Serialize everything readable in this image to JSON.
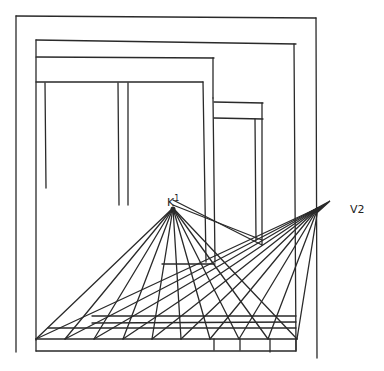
{
  "diagram": {
    "labels": {
      "v1": "V1",
      "v1_glyph": "K",
      "v1_sup": "1",
      "v2": "V2"
    },
    "colors": {
      "ink": "#2a2a2a",
      "background": "#ffffff"
    },
    "vanishing_points": {
      "v1": [
        173,
        208
      ],
      "v2": [
        318,
        208
      ]
    },
    "floor_points_x": [
      36,
      65,
      94,
      123,
      152,
      181,
      210,
      239,
      268,
      297
    ],
    "floor_base_y": 339
  }
}
